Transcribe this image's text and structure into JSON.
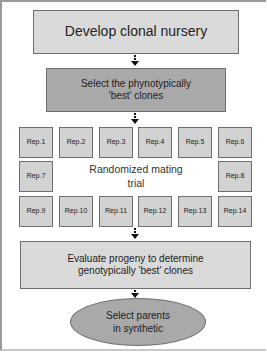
{
  "diagram": {
    "type": "flowchart",
    "steps": {
      "develop": "Develop clonal nursery",
      "select_pheno_line1": "Select the phynotypically",
      "select_pheno_line2": "'best' clones",
      "trial_label_line1": "Randomized mating",
      "trial_label_line2": "trial",
      "evaluate_line1": "Evaluate progeny to determine",
      "evaluate_line2": "genotypically 'best' clones",
      "select_parents_line1": "Select parents",
      "select_parents_line2": "in synthetic"
    },
    "reps": [
      "Rep.1",
      "Rep.2",
      "Rep.3",
      "Rep.4",
      "Rep.5",
      "Rep.6",
      "Rep.7",
      "Rep.8",
      "Rep.9",
      "Rep.10",
      "Rep.11",
      "Rep.12",
      "Rep.13",
      "Rep.14"
    ],
    "colors": {
      "light_box": "#dadada",
      "dark_box": "#a9a9a9",
      "rep_box": "#d2d2d2",
      "border": "#6e6e6e",
      "arrow": "#111111"
    }
  }
}
